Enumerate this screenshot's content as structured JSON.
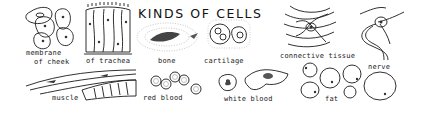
{
  "title": "KINDS OF CELLS",
  "labels": {
    "cheek": [
      "membrane",
      "of cheek"
    ],
    "trachea": "of trachea",
    "bone": "bone",
    "cartilage": "cartilage",
    "connective": "connective tissue",
    "nerve": "nerve",
    "muscle": "muscle",
    "red_blood": "red blood",
    "white_blood": "white blood",
    "fat": "fat"
  },
  "colors": {
    "ink": "#1a1a1a",
    "background": "#ffffff"
  }
}
